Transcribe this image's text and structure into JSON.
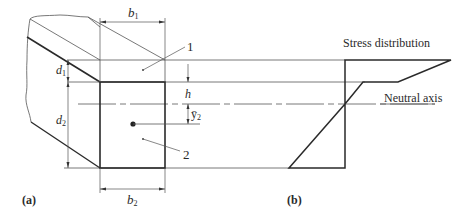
{
  "figure": {
    "panel_a_label": "(a)",
    "panel_b_label": "(b)"
  },
  "section": {
    "b1_label": "b",
    "b1_sub": "1",
    "b2_label": "b",
    "b2_sub": "2",
    "d1_label": "d",
    "d1_sub": "1",
    "d2_label": "d",
    "d2_sub": "2",
    "h_label": "h",
    "ybar2_label": "ȳ",
    "ybar2_sub": "2",
    "part1_label": "1",
    "part2_label": "2"
  },
  "stress": {
    "title": "Stress distribution",
    "neutral_axis_label": "Neutral axis"
  },
  "colors": {
    "line": "#2a2a2a",
    "thin_line": "#555555",
    "background": "#ffffff"
  }
}
